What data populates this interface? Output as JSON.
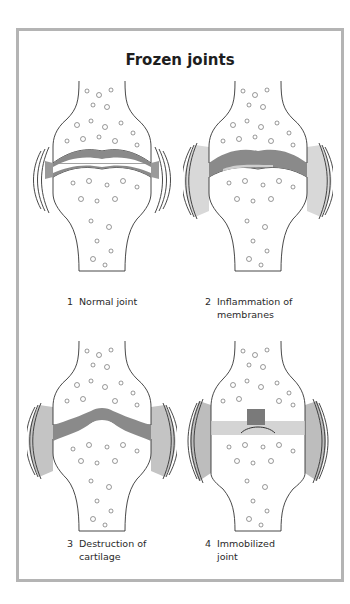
{
  "figure": {
    "title": "Frozen joints",
    "frame_border_color": "#b4b4b4",
    "panels": [
      {
        "number": "1",
        "label": "Normal joint",
        "state": "normal"
      },
      {
        "number": "2",
        "label": "Inflammation of membranes",
        "state": "inflamed"
      },
      {
        "number": "3",
        "label": "Destruction of cartilage",
        "state": "destroyed"
      },
      {
        "number": "4",
        "label": "Immobilized joint",
        "state": "immobilized"
      }
    ]
  }
}
